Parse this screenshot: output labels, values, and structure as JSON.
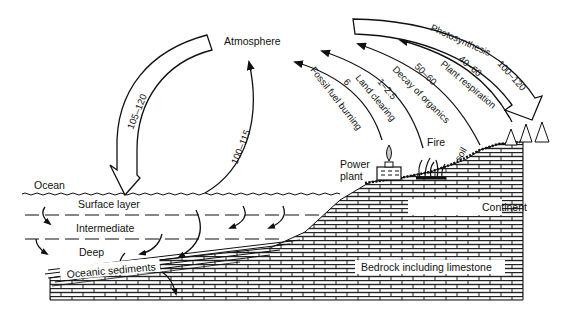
{
  "diagram": {
    "nodes": {
      "atmosphere": "Atmosphere",
      "ocean": "Ocean",
      "surface_layer": "Surface layer",
      "intermediate": "Intermediate",
      "deep": "Deep",
      "oceanic_sediments": "Oceanic sediments",
      "power_plant_line1": "Power",
      "power_plant_line2": "plant",
      "fire": "Fire",
      "soil": "soil",
      "continent": "Continent",
      "bedrock": "Bedrock including limestone"
    },
    "fluxes": {
      "ocean_to_atm": {
        "value": "100–115"
      },
      "atm_to_ocean": {
        "value": "105–120"
      },
      "fossil_fuel": {
        "label": "Fossil fuel burning",
        "value": "6"
      },
      "land_clearing": {
        "label": "Land clearing",
        "value": "1–2.5"
      },
      "decay": {
        "label": "Decay of organics",
        "value": "50–60"
      },
      "plant_respiration": {
        "label": "Plant respiration",
        "value": "40–60"
      },
      "photosynthesis": {
        "label": "Photosynthesis",
        "value": "100–120"
      }
    },
    "colors": {
      "ink": "#111111",
      "background": "#ffffff"
    }
  }
}
